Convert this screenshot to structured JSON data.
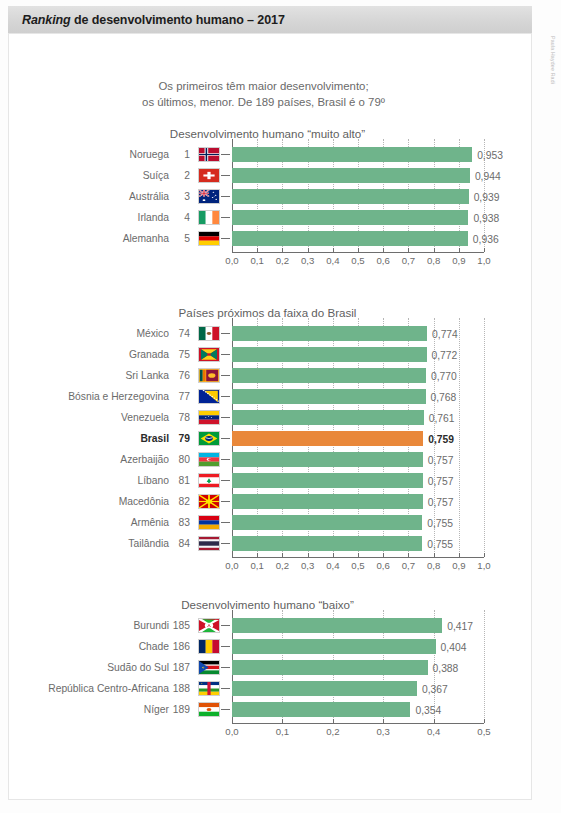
{
  "header": {
    "title_italic": "Ranking",
    "title_rest": " de desenvolvimento humano – 2017"
  },
  "credit": "Paula Haydee Radi",
  "subtitle": {
    "line1": "Os primeiros têm maior desenvolvimento;",
    "line2": "os últimos, menor. De 189 países, Brasil é o 79º"
  },
  "colors": {
    "bar_green": "#6fb48b",
    "bar_orange": "#e9883a",
    "axis": "#6e6e6e",
    "text": "#6b6b6b",
    "title_bar": "#d6d6d6"
  },
  "chart_data": [
    {
      "type": "bar",
      "title": "Desenvolvimento humano “muito alto”",
      "orientation": "horizontal",
      "xlabel": "",
      "ylabel": "",
      "xlim": [
        0,
        1.0
      ],
      "ticks": [
        "0,0",
        "0,1",
        "0,2",
        "0,3",
        "0,4",
        "0,5",
        "0,6",
        "0,7",
        "0,8",
        "0,9",
        "1,0"
      ],
      "tick_values": [
        0,
        0.1,
        0.2,
        0.3,
        0.4,
        0.5,
        0.6,
        0.7,
        0.8,
        0.9,
        1.0
      ],
      "grid": true,
      "categories": [
        "Noruega",
        "Suíça",
        "Austrália",
        "Irlanda",
        "Alemanha"
      ],
      "ranks": [
        "1",
        "2",
        "3",
        "4",
        "5"
      ],
      "values": [
        0.953,
        0.944,
        0.939,
        0.938,
        0.936
      ],
      "labels": [
        "0,953",
        "0,944",
        "0,939",
        "0,938",
        "0,936"
      ],
      "flags": [
        "norway",
        "switzerland",
        "australia",
        "ireland",
        "germany"
      ],
      "highlight": -1
    },
    {
      "type": "bar",
      "title": "Países próximos da faixa do Brasil",
      "orientation": "horizontal",
      "xlabel": "",
      "ylabel": "",
      "xlim": [
        0,
        1.0
      ],
      "ticks": [
        "0,0",
        "0,1",
        "0,2",
        "0,3",
        "0,4",
        "0,5",
        "0,6",
        "0,7",
        "0,8",
        "0,9",
        "1,0"
      ],
      "tick_values": [
        0,
        0.1,
        0.2,
        0.3,
        0.4,
        0.5,
        0.6,
        0.7,
        0.8,
        0.9,
        1.0
      ],
      "grid": true,
      "categories": [
        "México",
        "Granada",
        "Sri Lanka",
        "Bósnia e Herzegovina",
        "Venezuela",
        "Brasil",
        "Azerbaijão",
        "Líbano",
        "Macedônia",
        "Armênia",
        "Tailândia"
      ],
      "ranks": [
        "74",
        "75",
        "76",
        "77",
        "78",
        "79",
        "80",
        "81",
        "82",
        "83",
        "84"
      ],
      "values": [
        0.774,
        0.772,
        0.77,
        0.768,
        0.761,
        0.759,
        0.757,
        0.757,
        0.757,
        0.755,
        0.755
      ],
      "labels": [
        "0,774",
        "0,772",
        "0,770",
        "0,768",
        "0,761",
        "0,759",
        "0,757",
        "0,757",
        "0,757",
        "0,755",
        "0,755"
      ],
      "flags": [
        "mexico",
        "grenada",
        "srilanka",
        "bosnia",
        "venezuela",
        "brazil",
        "azerbaijan",
        "lebanon",
        "macedonia",
        "armenia",
        "thailand"
      ],
      "highlight": 5
    },
    {
      "type": "bar",
      "title": "Desenvolvimento humano “baixo”",
      "orientation": "horizontal",
      "xlabel": "",
      "ylabel": "",
      "xlim": [
        0,
        0.5
      ],
      "ticks": [
        "0,0",
        "0,1",
        "0,2",
        "0,3",
        "0,4",
        "0,5"
      ],
      "tick_values": [
        0,
        0.1,
        0.2,
        0.3,
        0.4,
        0.5
      ],
      "grid": true,
      "categories": [
        "Burundi",
        "Chade",
        "Sudão do Sul",
        "República Centro-Africana",
        "Níger"
      ],
      "ranks": [
        "185",
        "186",
        "187",
        "188",
        "189"
      ],
      "values": [
        0.417,
        0.404,
        0.388,
        0.367,
        0.354
      ],
      "labels": [
        "0,417",
        "0,404",
        "0,388",
        "0,367",
        "0,354"
      ],
      "flags": [
        "burundi",
        "chad",
        "southsudan",
        "car",
        "niger"
      ],
      "highlight": -1
    }
  ]
}
